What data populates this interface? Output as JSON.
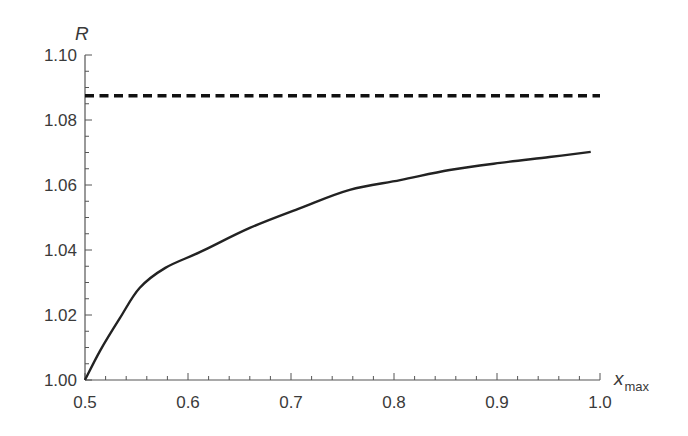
{
  "chart_data": {
    "type": "line",
    "title": "",
    "xlabel": "x",
    "xlabel_sub": "max",
    "ylabel": "R",
    "xlim": [
      0.5,
      1.0
    ],
    "ylim": [
      1.0,
      1.1
    ],
    "grid": false,
    "legend": null,
    "x_ticks": [
      0.5,
      0.6,
      0.7,
      0.8,
      0.9,
      1.0
    ],
    "x_tick_labels": [
      "0.5",
      "0.6",
      "0.7",
      "0.8",
      "0.9",
      "1.0"
    ],
    "y_ticks": [
      1.0,
      1.02,
      1.04,
      1.06,
      1.08,
      1.1
    ],
    "y_tick_labels": [
      "1.00",
      "1.02",
      "1.04",
      "1.06",
      "1.08",
      "1.10"
    ],
    "series": [
      {
        "name": "R(x_max)",
        "style": "solid",
        "color": "#222222",
        "x": [
          0.5,
          0.515,
          0.534,
          0.553,
          0.578,
          0.612,
          0.66,
          0.709,
          0.757,
          0.806,
          0.854,
          0.903,
          0.951,
          0.991
        ],
        "y": [
          1.0,
          1.0092,
          1.0191,
          1.0283,
          1.0345,
          1.0394,
          1.0468,
          1.0529,
          1.0585,
          1.0615,
          1.0646,
          1.0668,
          1.0686,
          1.0702
        ]
      },
      {
        "name": "asymptote",
        "style": "dashed",
        "color": "#111111",
        "x": [
          0.5,
          1.0
        ],
        "y": [
          1.0875,
          1.0875
        ]
      }
    ]
  }
}
